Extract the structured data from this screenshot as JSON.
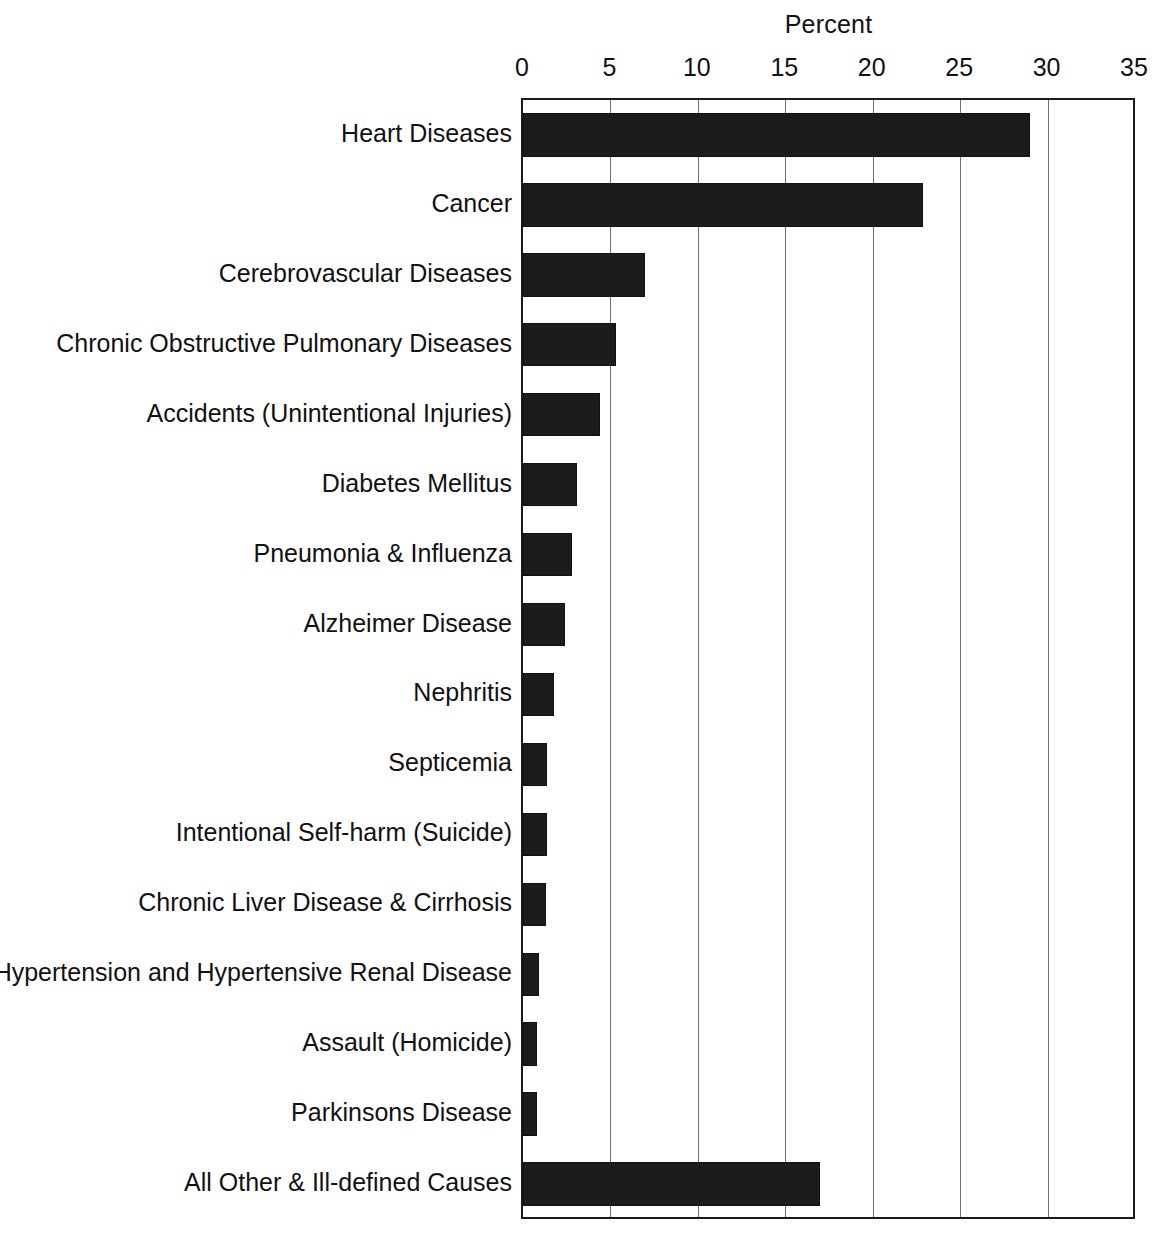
{
  "chart_data": {
    "type": "bar",
    "orientation": "horizontal",
    "title": "",
    "xlabel": "Percent",
    "ylabel": "",
    "xlim": [
      0,
      35
    ],
    "xticks": [
      0,
      5,
      10,
      15,
      20,
      25,
      30,
      35
    ],
    "xtick_labels": [
      "0",
      "5",
      "10",
      "15",
      "20",
      "25",
      "30",
      "35"
    ],
    "grid": "vertical",
    "legend": "none",
    "bar_color": "#1c1c1c",
    "categories": [
      "Heart Diseases",
      "Cancer",
      "Cerebrovascular Diseases",
      "Chronic Obstructive Pulmonary Diseases",
      "Accidents (Unintentional Injuries)",
      "Diabetes Mellitus",
      "Pneumonia & Influenza",
      "Alzheimer Disease",
      "Nephritis",
      "Septicemia",
      "Intentional Self-harm (Suicide)",
      "Chronic Liver Disease & Cirrhosis",
      "Hypertension and Hypertensive Renal Disease",
      "Assault (Homicide)",
      "Parkinsons Disease",
      "All Other & Ill-defined Causes"
    ],
    "values": [
      29.0,
      22.9,
      7.0,
      5.3,
      4.4,
      3.1,
      2.8,
      2.4,
      1.8,
      1.4,
      1.4,
      1.3,
      0.9,
      0.8,
      0.8,
      17.0
    ]
  }
}
